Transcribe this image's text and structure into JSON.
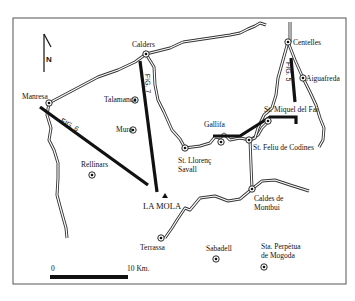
{
  "map": {
    "north_label": "N",
    "summit": {
      "label": "LA MOLA",
      "x": 176,
      "y": 211
    },
    "towns": [
      {
        "name": "Calders",
        "x": 146,
        "y": 54
      },
      {
        "name": "Manresa",
        "x": 49,
        "y": 103
      },
      {
        "name": "Talamanca",
        "x": 135,
        "y": 100
      },
      {
        "name": "Mura",
        "x": 133,
        "y": 130
      },
      {
        "name": "Rellinars",
        "x": 92,
        "y": 175
      },
      {
        "name": "Centelles",
        "x": 288,
        "y": 42
      },
      {
        "name": "Aiguafreda",
        "x": 303,
        "y": 78
      },
      {
        "name": "Gallifa",
        "x": 221,
        "y": 142
      },
      {
        "name": "St. Miquel del Fai",
        "x": 268,
        "y": 122
      },
      {
        "name": "St. Feliu de Codines",
        "x": 250,
        "y": 140
      },
      {
        "name": "St. Llorenç Savall",
        "x": 185,
        "y": 148
      },
      {
        "name": "Caldes de Montbui",
        "x": 252,
        "y": 189
      },
      {
        "name": "Terrassa",
        "x": 161,
        "y": 238
      },
      {
        "name": "Sabadell",
        "x": 215,
        "y": 259
      },
      {
        "name": "Sta. Perpètua de Mogoda",
        "x": 264,
        "y": 267
      }
    ],
    "labels": {
      "calders": "Calders",
      "manresa": "Manresa",
      "talamanca": "Talamanca",
      "mura": "Mura",
      "rellinars": "Rellinars",
      "centelles": "Centelles",
      "aiguafreda": "Aiguafreda",
      "gallifa": "Gallifa",
      "st_miquel": "St. Miquel del Fai",
      "st_feliu": "St. Feliu de Codines",
      "st_llorenc_1": "St. Llorenç",
      "st_llorenc_2": "Savall",
      "caldes_1": "Caldes de",
      "caldes_2": "Montbui",
      "terrassa": "Terrassa",
      "sabadell": "Sabadell",
      "sta_perpetua_1": "Sta. Perpètua",
      "sta_perpetua_2": "de Mogoda",
      "la_mola": "LA MOLA"
    },
    "figure_lines": [
      {
        "label": "FIG. 5"
      },
      {
        "label": "FIG. 6"
      },
      {
        "label": "FIG. 7"
      }
    ],
    "scale_bar": {
      "start_label": "0",
      "end_label": "10 Km."
    }
  }
}
